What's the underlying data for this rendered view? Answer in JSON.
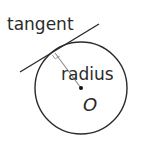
{
  "diagram": {
    "labels": {
      "tangent": "tangent",
      "radius": "radius",
      "center": "O"
    },
    "colors": {
      "stroke": "#2b2b2b",
      "radius_line": "#8a8a8a",
      "right_angle": "#9a9a9a",
      "background": "#ffffff"
    },
    "elements": [
      "circle with center O",
      "tangent line touching circle",
      "radius from center O to point of tangency",
      "right-angle marker at point of tangency"
    ]
  }
}
